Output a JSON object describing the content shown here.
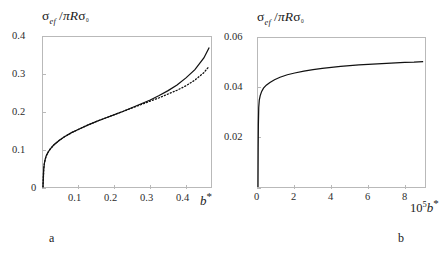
{
  "figure": {
    "panels": [
      {
        "id": "a",
        "panel_label": "a",
        "ylabel": {
          "numerator": "σ",
          "numerator_sub": "ef",
          "denominator": "πRσ",
          "denominator_sub": "0",
          "full": "σef /πRσ0"
        },
        "xlabel": {
          "prefix": "",
          "symbol": "b",
          "star": "*",
          "full": "b*"
        },
        "yticks": [
          "0",
          "0.1",
          "0.2",
          "0.3",
          "0.4"
        ],
        "xticks": [
          "0.1",
          "0.2",
          "0.3",
          "0.4"
        ]
      },
      {
        "id": "b",
        "panel_label": "b",
        "ylabel": {
          "numerator": "σ",
          "numerator_sub": "ef",
          "denominator": "πRσ",
          "denominator_sub": "0",
          "full": "σef /πRσ0"
        },
        "xlabel": {
          "prefix": "10",
          "prefix_exp": "5",
          "symbol": "b",
          "star": "*",
          "full": "10^5 b*"
        },
        "yticks": [
          "0.02",
          "0.04",
          "0.06"
        ],
        "xticks": [
          "0",
          "2",
          "4",
          "6",
          "8"
        ]
      }
    ]
  },
  "chart_data": [
    {
      "type": "line",
      "panel": "a",
      "title": "",
      "xlabel": "b*",
      "ylabel": "σ_ef / πRσ_0",
      "xlim": [
        0,
        0.47
      ],
      "ylim": [
        0,
        0.4
      ],
      "xticks": [
        0.1,
        0.2,
        0.3,
        0.4
      ],
      "yticks": [
        0,
        0.1,
        0.2,
        0.3,
        0.4
      ],
      "grid": false,
      "legend": "none",
      "series": [
        {
          "name": "exact (solid)",
          "style": "solid",
          "color": "#111111",
          "x": [
            0.0,
            0.002,
            0.004,
            0.006,
            0.008,
            0.01,
            0.015,
            0.02,
            0.03,
            0.045,
            0.06,
            0.08,
            0.1,
            0.125,
            0.15,
            0.175,
            0.2,
            0.225,
            0.25,
            0.275,
            0.3,
            0.325,
            0.35,
            0.375,
            0.4,
            0.425,
            0.45,
            0.465
          ],
          "y": [
            0.0,
            0.048,
            0.064,
            0.073,
            0.08,
            0.085,
            0.094,
            0.101,
            0.112,
            0.124,
            0.134,
            0.145,
            0.154,
            0.165,
            0.175,
            0.184,
            0.193,
            0.202,
            0.212,
            0.222,
            0.232,
            0.244,
            0.257,
            0.272,
            0.291,
            0.313,
            0.344,
            0.372
          ]
        },
        {
          "name": "asymptotic (dotted)",
          "style": "dotted",
          "color": "#111111",
          "x": [
            0.0,
            0.002,
            0.004,
            0.006,
            0.008,
            0.01,
            0.015,
            0.02,
            0.03,
            0.045,
            0.06,
            0.08,
            0.1,
            0.125,
            0.15,
            0.175,
            0.2,
            0.225,
            0.25,
            0.275,
            0.3,
            0.325,
            0.35,
            0.375,
            0.4,
            0.425,
            0.45,
            0.465
          ],
          "y": [
            0.0,
            0.048,
            0.064,
            0.073,
            0.08,
            0.085,
            0.094,
            0.101,
            0.112,
            0.124,
            0.134,
            0.145,
            0.154,
            0.165,
            0.175,
            0.184,
            0.193,
            0.202,
            0.211,
            0.22,
            0.229,
            0.238,
            0.248,
            0.258,
            0.27,
            0.285,
            0.305,
            0.322
          ]
        }
      ]
    },
    {
      "type": "line",
      "panel": "b",
      "title": "",
      "xlabel": "10^5 b*",
      "ylabel": "σ_ef / πRσ_0",
      "xlim": [
        0,
        9.1
      ],
      "ylim": [
        0,
        0.06
      ],
      "xticks": [
        0,
        2,
        4,
        6,
        8
      ],
      "yticks": [
        0.02,
        0.04,
        0.06
      ],
      "grid": false,
      "legend": "none",
      "series": [
        {
          "name": "exact (solid)",
          "style": "solid",
          "color": "#111111",
          "x": [
            0.0,
            0.01,
            0.02,
            0.04,
            0.07,
            0.12,
            0.2,
            0.3,
            0.45,
            0.65,
            0.9,
            1.2,
            1.6,
            2.0,
            2.5,
            3.0,
            3.5,
            4.0,
            4.5,
            5.0,
            5.5,
            6.0,
            6.5,
            7.0,
            7.5,
            8.0,
            8.5,
            9.0
          ],
          "y": [
            0.0,
            0.016,
            0.025,
            0.032,
            0.035,
            0.0368,
            0.0385,
            0.0398,
            0.041,
            0.0421,
            0.0432,
            0.0442,
            0.0452,
            0.0459,
            0.0467,
            0.0473,
            0.0478,
            0.0482,
            0.0486,
            0.0489,
            0.0492,
            0.0494,
            0.0496,
            0.0498,
            0.05,
            0.0502,
            0.0503,
            0.0505
          ]
        }
      ]
    }
  ]
}
